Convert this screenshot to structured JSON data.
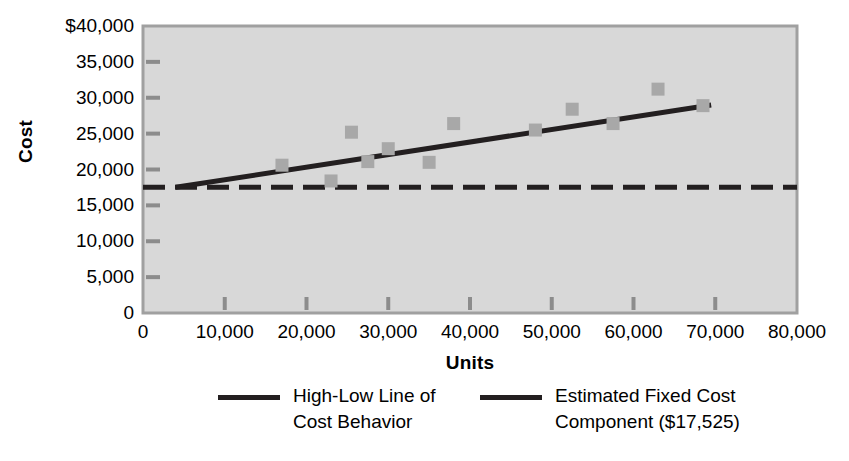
{
  "chart_data": {
    "type": "scatter",
    "title": "",
    "xlabel": "Units",
    "ylabel": "Cost",
    "xlim": [
      0,
      80000
    ],
    "ylim": [
      0,
      40000
    ],
    "grid": false,
    "legend_position": "bottom",
    "x_ticks": [
      "0",
      "10,000",
      "20,000",
      "30,000",
      "40,000",
      "50,000",
      "60,000",
      "70,000",
      "80,000"
    ],
    "x_tick_values": [
      0,
      10000,
      20000,
      30000,
      40000,
      50000,
      60000,
      70000,
      80000
    ],
    "y_ticks": [
      "$40,000",
      "35,000",
      "30,000",
      "25,000",
      "20,000",
      "15,000",
      "10,000",
      "5,000",
      "0"
    ],
    "y_tick_values": [
      40000,
      35000,
      30000,
      25000,
      20000,
      15000,
      10000,
      5000,
      0
    ],
    "points": [
      {
        "x": 17000,
        "y": 20600
      },
      {
        "x": 23000,
        "y": 18400
      },
      {
        "x": 25500,
        "y": 25200
      },
      {
        "x": 27500,
        "y": 21100
      },
      {
        "x": 30000,
        "y": 22900
      },
      {
        "x": 35000,
        "y": 21000
      },
      {
        "x": 38000,
        "y": 26400
      },
      {
        "x": 48000,
        "y": 25500
      },
      {
        "x": 52500,
        "y": 28400
      },
      {
        "x": 57500,
        "y": 26400
      },
      {
        "x": 63000,
        "y": 31200
      },
      {
        "x": 68500,
        "y": 28900
      }
    ],
    "series": [
      {
        "name": "High-Low Line of Cost Behavior",
        "type": "line",
        "style": "solid",
        "color": "#231f20",
        "x": [
          4000,
          69500
        ],
        "values": [
          17525,
          29000
        ]
      },
      {
        "name": "Estimated Fixed Cost Component ($17,525)",
        "type": "line",
        "style": "dashed",
        "color": "#231f20",
        "x": [
          0,
          80000
        ],
        "values": [
          17525,
          17525
        ]
      }
    ],
    "marker_color": "#a8a8a8",
    "plot_background": "#d8d8d8"
  },
  "legend": {
    "items": [
      {
        "label": "High-Low Line of\nCost Behavior",
        "swatch": "solid-line-swatch"
      },
      {
        "label": "Estimated Fixed Cost\nComponent ($17,525)",
        "swatch": "solid-line-swatch"
      }
    ]
  },
  "axis": {
    "y_title": "Cost",
    "x_title": "Units"
  }
}
